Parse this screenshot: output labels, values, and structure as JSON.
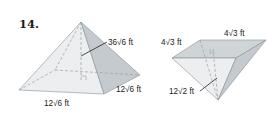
{
  "problem": {
    "number": "14."
  },
  "figures": [
    {
      "name": "square-pyramid",
      "labels": {
        "slant_height": "36√6 ft",
        "base_front": "12√6 ft",
        "base_side": "12√6 ft"
      }
    },
    {
      "name": "inverted-triangular-pyramid",
      "labels": {
        "top_left_edge": "4√3 ft",
        "top_back_edge": "4√3 ft",
        "slant_height": "12√2 ft"
      }
    }
  ],
  "colors": {
    "face_light": "#e9ecee",
    "face_mid": "#d7dcdf",
    "face_dark": "#bfc5c9",
    "edge": "#8a9094",
    "hidden": "#9aa0a4",
    "leader": "#222222"
  }
}
